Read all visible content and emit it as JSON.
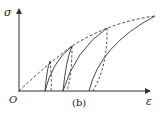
{
  "figure": {
    "y_axis_label": "σ",
    "x_axis_label": "ε",
    "origin_label": "O",
    "caption": "(b)"
  },
  "colors": {
    "line": "#333333",
    "background": "#ffffff"
  },
  "curves": {
    "envelope": {
      "style": "dashed",
      "description": "monotonic envelope curve from origin"
    },
    "loading_branches": [
      {
        "style": "solid",
        "start_x": 45,
        "peak": [
          72,
          45
        ]
      },
      {
        "style": "solid",
        "start_x": 63,
        "peak": [
          107,
          28
        ]
      },
      {
        "style": "solid",
        "start_x": 89,
        "peak": [
          155,
          16
        ]
      }
    ],
    "unloading_branches": [
      {
        "style": "dashed",
        "from_peak": [
          50,
          60
        ],
        "end_x": 51
      },
      {
        "style": "dashed",
        "from_peak": [
          72,
          45
        ],
        "end_x": 67
      },
      {
        "style": "dashed",
        "from_peak": [
          107,
          28
        ],
        "end_x": 93
      }
    ]
  }
}
